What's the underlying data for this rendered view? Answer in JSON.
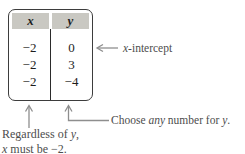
{
  "figure": {
    "table": {
      "headers": [
        "x",
        "y"
      ],
      "rows": [
        [
          "−2",
          "0"
        ],
        [
          "−2",
          "3"
        ],
        [
          "−2",
          "−4"
        ]
      ]
    },
    "callouts": {
      "x_intercept": {
        "italic": "x",
        "rest": "-intercept"
      },
      "choose": {
        "t1": "Choose ",
        "i1": "any",
        "t2": " number for ",
        "i2": "y",
        "t3": "."
      },
      "regardless": {
        "l1t1": "Regardless of ",
        "l1i": "y",
        "l1t2": ",",
        "l2i": "x",
        "l2t": " must be −2."
      }
    },
    "colors": {
      "header_fill": "#c9c8c2",
      "table_border": "#3d3d3d",
      "table_text": "#1d1d1d",
      "annotation_text": "#4d4d4d",
      "arrow": "#8e8e8e",
      "background": "#ffffff"
    }
  }
}
